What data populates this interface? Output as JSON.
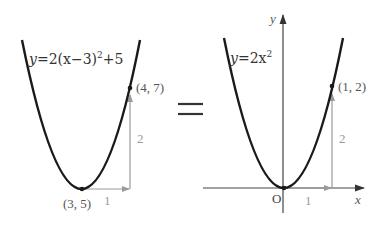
{
  "left_graph": {
    "equation_prefix": "y",
    "equation_body": "=2(x−3)",
    "equation_exp": "2",
    "equation_suffix": "+5",
    "vertex_label": "(3, 5)",
    "point_label": "(4, 7)",
    "run_label": "1",
    "rise_label": "2"
  },
  "equals_sign": "=",
  "right_graph": {
    "equation_prefix": "y",
    "equation_body": "=2x",
    "equation_exp": "2",
    "point_label": "(1, 2)",
    "run_label": "1",
    "rise_label": "2",
    "x_axis_label": "x",
    "y_axis_label": "y",
    "origin_label": "O"
  },
  "colors": {
    "curve": "#1a1a1a",
    "step_arrow": "#9a9a9a",
    "axis": "#444444"
  }
}
